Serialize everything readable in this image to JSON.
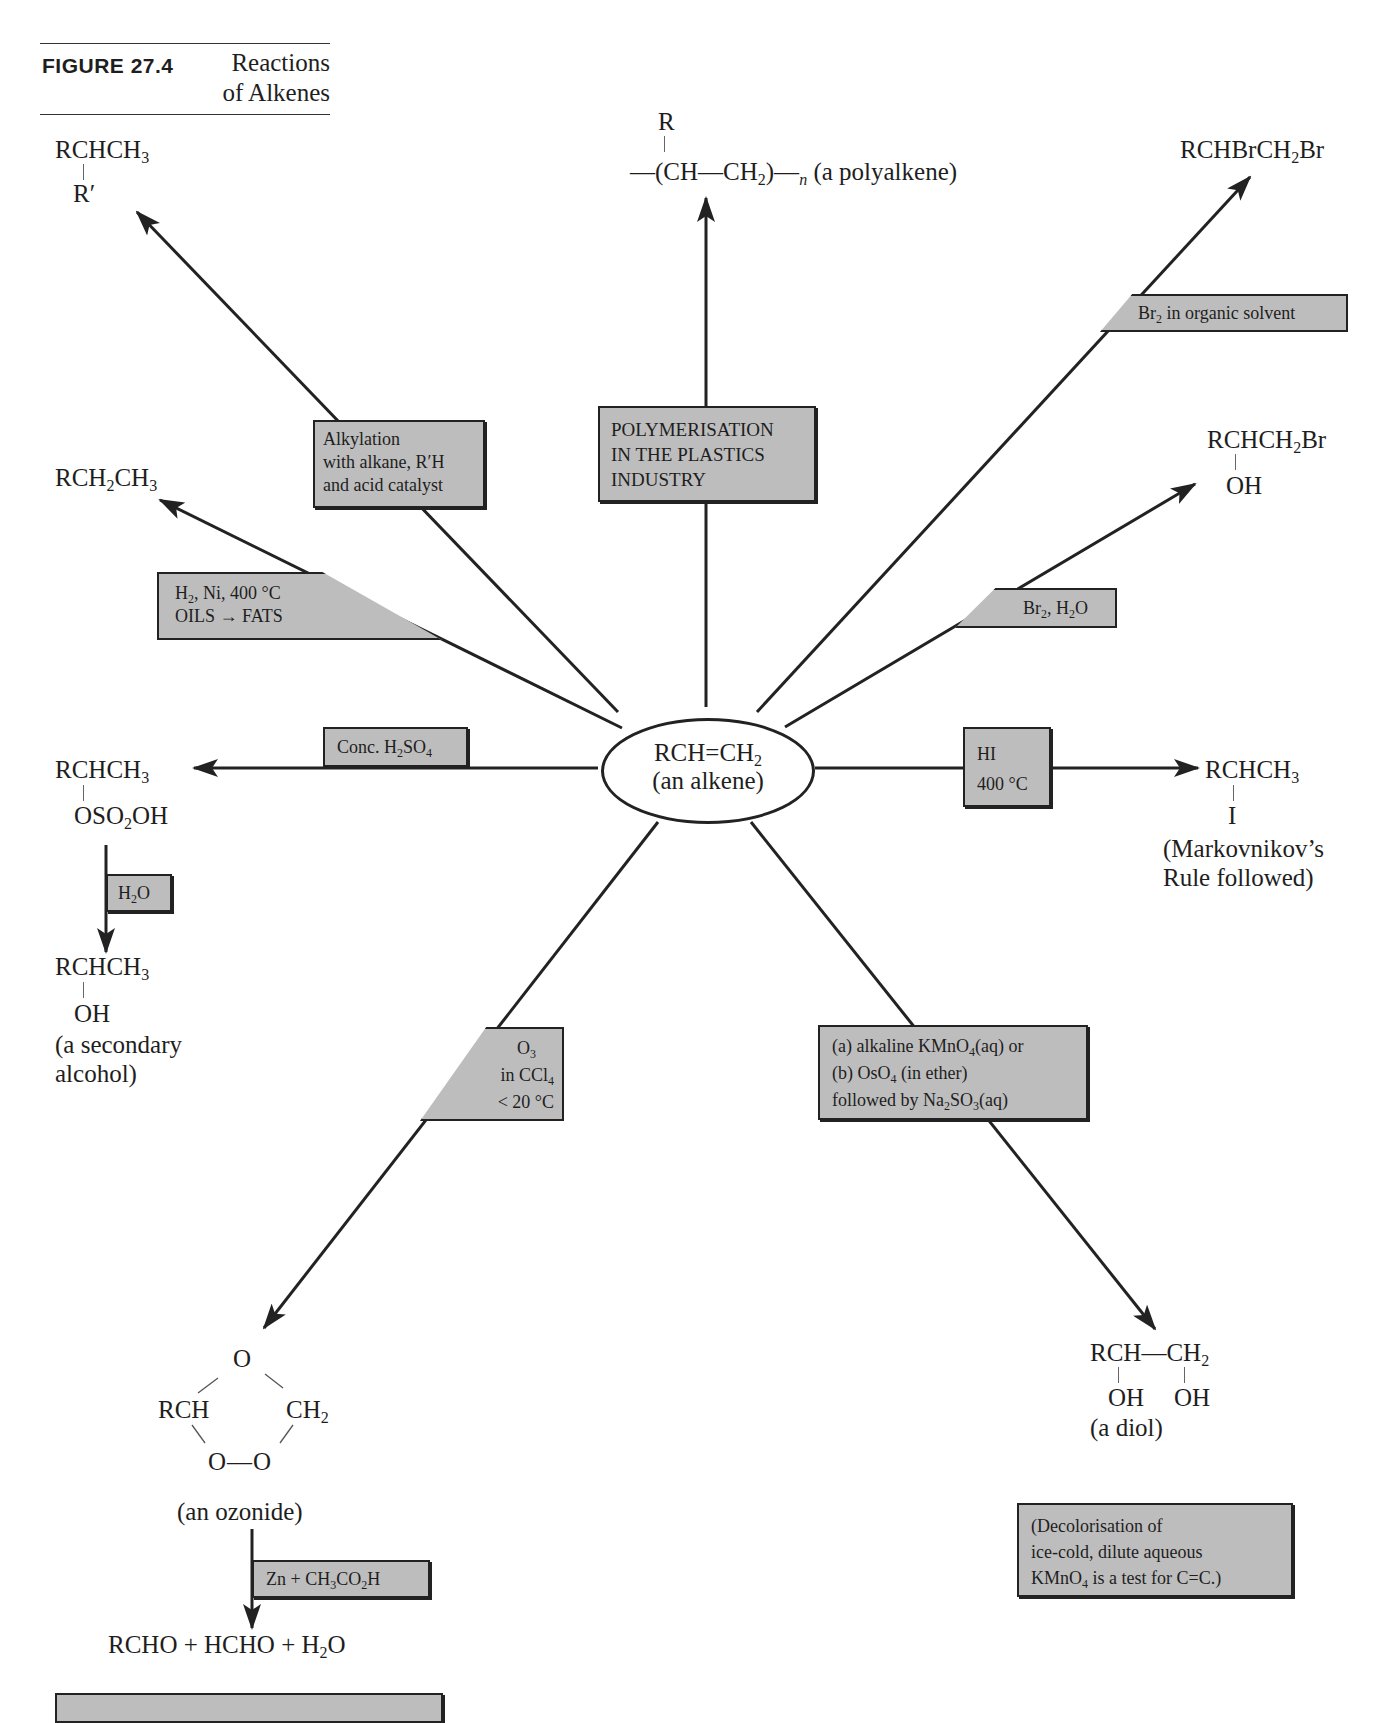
{
  "page_header": {
    "running_title": "ALKENES AND ALKYNES"
  },
  "figure": {
    "label": "FIGURE 27.4",
    "title_line1": "Reactions",
    "title_line2": "of Alkenes",
    "colors": {
      "box_fill": "#bdbdbd",
      "line": "#222222",
      "text": "#1e1e1e"
    }
  },
  "center": {
    "formula_left": "RCH",
    "formula_mid": "=CH",
    "formula_sub": "2",
    "caption": "(an alkene)"
  },
  "products": {
    "alkylation": {
      "main": "RCHCH",
      "sub": "3",
      "branch": "R′"
    },
    "polymer": {
      "branch": "R",
      "chain": "—(CH—CH",
      "sub": "2",
      "close": ")—",
      "n": "n",
      "label": "(a polyalkene)"
    },
    "dibromide": {
      "p1": "RCHBrCH",
      "sub": "2",
      "p2": "Br"
    },
    "alkane": {
      "p1": "RCH",
      "sub1": "2",
      "p2": "CH",
      "sub2": "3"
    },
    "bromohydrin": {
      "p1": "RCHCH",
      "sub": "2",
      "p2": "Br",
      "branch": "OH"
    },
    "hydrogen_sulfate": {
      "main": "RCHCH",
      "sub": "3",
      "branch_p1": "OSO",
      "branch_sub": "2",
      "branch_p2": "OH"
    },
    "secondary_alcohol": {
      "main": "RCHCH",
      "sub": "3",
      "branch": "OH",
      "caption_l1": "(a secondary",
      "caption_l2": "alcohol)"
    },
    "iodoalkane": {
      "main": "RCHCH",
      "sub": "3",
      "branch": "I",
      "note_l1": "(Markovnikov’s",
      "note_l2": "Rule followed)"
    },
    "ozonide": {
      "top_o": "O",
      "left": "RCH",
      "right": "CH",
      "right_sub": "2",
      "bottom": "O—O",
      "caption": "(an ozonide)"
    },
    "ozonolysis_products": {
      "p1": "RCHO + HCHO + H",
      "sub": "2",
      "p2": "O"
    },
    "diol": {
      "main_l": "RCH—CH",
      "sub": "2",
      "oh1": "OH",
      "oh2": "OH",
      "caption": "(a diol)"
    }
  },
  "conditions": {
    "alkylation": [
      "Alkylation",
      "with alkane, R′H",
      "and acid catalyst"
    ],
    "polymerisation": [
      "POLYMERISATION",
      "IN THE PLASTICS",
      "INDUSTRY"
    ],
    "bromination": {
      "p1": "Br",
      "sub": "2",
      "p2": " in organic solvent"
    },
    "hydrogenation": {
      "line1_p1": "H",
      "line1_sub": "2",
      "line1_p2": ", Ni, 400 °C",
      "line2": "OILS → FATS"
    },
    "bromine_water": {
      "p1": "Br",
      "sub1": "2",
      "p2": ", H",
      "sub2": "2",
      "p3": "O"
    },
    "sulfuric_acid": {
      "p1": "Conc. H",
      "sub1": "2",
      "p2": "SO",
      "sub2": "4"
    },
    "hydrolysis": {
      "p1": "H",
      "sub": "2",
      "p2": "O"
    },
    "hydrogen_iodide": {
      "line1": "HI",
      "line2": "400 °C"
    },
    "ozone": {
      "line1_p1": "O",
      "line1_sub": "3",
      "line2_p1": "in CCl",
      "line2_sub": "4",
      "line3": "< 20 °C"
    },
    "oxidation": {
      "line1_p1": "(a)  alkaline KMnO",
      "line1_sub": "4",
      "line1_p2": "(aq) or",
      "line2_p1": "(b)  OsO",
      "line2_sub": "4",
      "line2_p2": " (in ether)",
      "line3_p1": "followed by Na",
      "line3_sub1": "2",
      "line3_p2": "SO",
      "line3_sub2": "3",
      "line3_p3": "(aq)"
    },
    "zinc_reduction": {
      "p1": "Zn + CH",
      "sub1": "3",
      "p2": "CO",
      "sub2": "2",
      "p3": "H"
    }
  },
  "test_note": {
    "line1": "(Decolorisation of",
    "line2": "ice-cold, dilute aqueous",
    "line3_p1": "KMnO",
    "line3_sub": "4",
    "line3_p2": " is a test for C=C.)"
  }
}
